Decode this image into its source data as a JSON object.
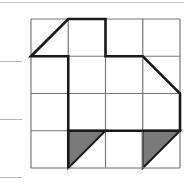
{
  "figure": {
    "type": "grid-shape-diagram",
    "grid": {
      "rows": 4,
      "cols": 4,
      "origin": [
        31,
        19
      ],
      "cell": 37.25
    },
    "colors": {
      "grid": "#777777",
      "outline": "#1a1a1a",
      "shade": "#7a7a7a"
    },
    "outline_points_cells": [
      [
        0,
        1
      ],
      [
        1,
        0
      ],
      [
        2,
        0
      ],
      [
        2,
        1
      ],
      [
        3,
        1
      ],
      [
        4,
        2
      ],
      [
        4,
        3
      ],
      [
        1,
        3
      ],
      [
        1,
        4
      ],
      [
        1,
        1
      ]
    ],
    "shaded_triangles_cells": [
      [
        [
          1,
          3
        ],
        [
          2,
          3
        ],
        [
          1,
          4
        ]
      ],
      [
        [
          3,
          3
        ],
        [
          4,
          3
        ],
        [
          3,
          4
        ]
      ]
    ],
    "answer_lines": 3
  }
}
